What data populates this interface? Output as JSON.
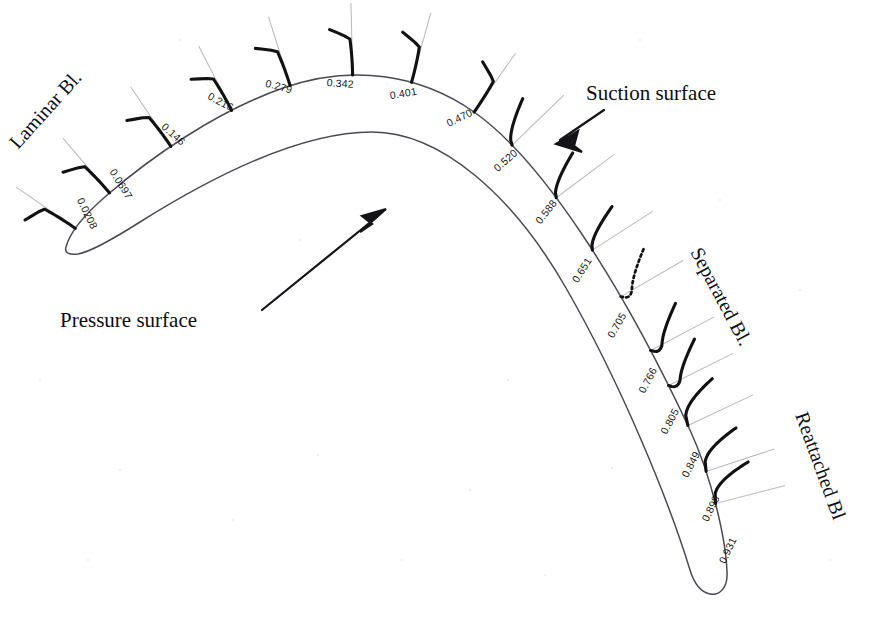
{
  "figure": {
    "background_color": "#ffffff",
    "line_color": "#4a4a52",
    "profile_color": "#111114",
    "normal_line_color": "#b9b9c0",
    "width": 879,
    "height": 626
  },
  "annotations": [
    {
      "name": "suction-surface",
      "text": "Suction surface"
    },
    {
      "name": "pressure-surface",
      "text": "Pressure surface"
    }
  ],
  "regimes": [
    {
      "name": "laminar",
      "text": "Laminar Bl.",
      "rotation": -48
    },
    {
      "name": "separated",
      "text": "Separated Bl.",
      "rotation": 62
    },
    {
      "name": "reattached",
      "text": "Reattached Bl",
      "rotation": 70
    }
  ],
  "chart_data": {
    "type": "line",
    "xlabel": "Normalised surface distance s/s_max",
    "ylabel": "Velocity profile (wall-normal)",
    "categories": [
      "0.0208",
      "0.0697",
      "0.146",
      "0.216",
      "0.279",
      "0.342",
      "0.401",
      "0.470",
      "0.520",
      "0.588",
      "0.651",
      "0.705",
      "0.766",
      "0.805",
      "0.849",
      "0.898",
      "0.931"
    ],
    "values": [
      0.0208,
      0.0697,
      0.146,
      0.216,
      0.279,
      0.342,
      0.401,
      0.47,
      0.52,
      0.588,
      0.651,
      0.705,
      0.766,
      0.805,
      0.849,
      0.898,
      0.931
    ],
    "series": [
      {
        "name": "boundary-layer-state",
        "values": [
          "laminar",
          "laminar",
          "laminar",
          "laminar",
          "laminar",
          "laminar",
          "laminar",
          "laminar",
          "transitional",
          "transitional",
          "transitional",
          "separated",
          "separated",
          "separated",
          "reattached",
          "reattached",
          "reattached"
        ]
      }
    ],
    "legend_position": "none",
    "grid": false
  },
  "stations": [
    {
      "label": "0.0208",
      "s": 0.0208,
      "state": "laminar",
      "lx": 84,
      "ly": 215,
      "lrot": 64
    },
    {
      "label": "0.0697",
      "s": 0.0697,
      "state": "laminar",
      "lx": 118,
      "ly": 186,
      "lrot": 58
    },
    {
      "label": "0.146",
      "s": 0.146,
      "state": "laminar",
      "lx": 171,
      "ly": 137,
      "lrot": 42
    },
    {
      "label": "0.216",
      "s": 0.216,
      "state": "laminar",
      "lx": 219,
      "ly": 105,
      "lrot": 28
    },
    {
      "label": "0.279",
      "s": 0.279,
      "state": "laminar",
      "lx": 278,
      "ly": 90,
      "lrot": 15
    },
    {
      "label": "0.342",
      "s": 0.342,
      "state": "laminar",
      "lx": 340,
      "ly": 87,
      "lrot": 4
    },
    {
      "label": "0.401",
      "s": 0.401,
      "state": "laminar",
      "lx": 404,
      "ly": 97,
      "lrot": -10
    },
    {
      "label": "0.470",
      "s": 0.47,
      "state": "laminar",
      "lx": 461,
      "ly": 121,
      "lrot": -26
    },
    {
      "label": "0.520",
      "s": 0.52,
      "state": "transitional",
      "lx": 508,
      "ly": 163,
      "lrot": -42
    },
    {
      "label": "0.588",
      "s": 0.588,
      "state": "transitional",
      "lx": 549,
      "ly": 214,
      "lrot": -52
    },
    {
      "label": "0.651",
      "s": 0.651,
      "state": "transitional",
      "lx": 585,
      "ly": 272,
      "lrot": -58
    },
    {
      "label": "0.705",
      "s": 0.705,
      "state": "separated",
      "lx": 620,
      "ly": 327,
      "lrot": -60
    },
    {
      "label": "0.766",
      "s": 0.766,
      "state": "separated",
      "lx": 651,
      "ly": 382,
      "lrot": -62
    },
    {
      "label": "0.805",
      "s": 0.805,
      "state": "separated",
      "lx": 673,
      "ly": 423,
      "lrot": -62
    },
    {
      "label": "0.849",
      "s": 0.849,
      "state": "reattached",
      "lx": 694,
      "ly": 466,
      "lrot": -63
    },
    {
      "label": "0.898",
      "s": 0.898,
      "state": "reattached",
      "lx": 714,
      "ly": 510,
      "lrot": -64
    },
    {
      "label": "0.931",
      "s": 0.931,
      "state": "reattached",
      "lx": 731,
      "ly": 552,
      "lrot": -65
    }
  ]
}
